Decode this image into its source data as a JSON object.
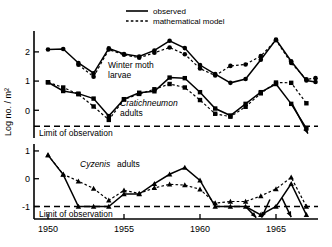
{
  "chart_data": {
    "type": "line",
    "title": "",
    "xlabel": "",
    "ylabel": "Log no. / m²",
    "xlim": [
      1949.3,
      1967.9
    ],
    "xticks": [
      1950,
      1955,
      1960,
      1965
    ],
    "xticklabels": [
      "1950",
      "1955",
      "1960",
      "1965"
    ],
    "grid": false,
    "legend": {
      "position": "top-center",
      "entries": [
        {
          "label": "observed",
          "style": "solid"
        },
        {
          "label": "mathematical model",
          "style": "dashed"
        }
      ]
    },
    "panels": [
      {
        "name": "upper-panel",
        "ylim": [
          -0.95,
          2.75
        ],
        "yticks": [
          0,
          1,
          2
        ],
        "yticklabels": [
          "0",
          "1",
          "2"
        ],
        "limit_of_observation": {
          "label": "Limit of observation",
          "value": -0.55
        },
        "series": [
          {
            "name": "Winter moth larvae",
            "annotation": "Winter moth\nlarvae",
            "annotation_italic": false,
            "marker": "circle",
            "style": "solid",
            "x": [
              1950,
              1951,
              1952,
              1953,
              1954,
              1955,
              1956,
              1957,
              1958,
              1959,
              1960,
              1961,
              1962,
              1963,
              1964,
              1965,
              1966,
              1967,
              1967.6
            ],
            "y": [
              2.08,
              2.1,
              1.62,
              1.27,
              2.12,
              1.93,
              1.84,
              2.05,
              2.38,
              2.13,
              1.55,
              1.24,
              0.94,
              1.07,
              1.73,
              2.42,
              1.68,
              1.02,
              0.97
            ]
          },
          {
            "name": "Winter moth larvae model",
            "marker": "circle",
            "style": "dashed",
            "x": [
              1952,
              1953,
              1954,
              1955,
              1956,
              1957,
              1958,
              1959,
              1960,
              1961,
              1962,
              1963,
              1964,
              1965,
              1966,
              1967,
              1967.6
            ],
            "y": [
              1.56,
              1.15,
              2.08,
              1.9,
              1.8,
              1.97,
              2.15,
              1.92,
              1.43,
              1.19,
              1.52,
              1.57,
              1.86,
              2.4,
              1.62,
              1.06,
              1.1
            ]
          },
          {
            "name": "Cratichneumon adults",
            "annotation": "Cratichneumon\nadults",
            "annotation_italic": true,
            "marker": "square",
            "style": "solid",
            "x": [
              1950,
              1951,
              1952,
              1953,
              1954,
              1955,
              1956,
              1957,
              1958,
              1959,
              1960,
              1961,
              1962,
              1963,
              1964,
              1965,
              1966,
              1967
            ],
            "y": [
              0.96,
              0.66,
              0.57,
              0.4,
              -0.2,
              0.38,
              0.6,
              0.65,
              1.12,
              1.1,
              0.62,
              0.06,
              -0.18,
              0.22,
              0.62,
              0.9,
              0.22,
              -0.62
            ]
          },
          {
            "name": "Cratichneumon adults model",
            "marker": "square",
            "style": "dashed",
            "x": [
              1950,
              1951,
              1952,
              1953,
              1954,
              1955,
              1956,
              1957,
              1958,
              1959,
              1960,
              1961,
              1962,
              1963,
              1964,
              1965,
              1966,
              1967
            ],
            "y": [
              0.96,
              0.78,
              0.55,
              0.13,
              -0.33,
              0.37,
              0.56,
              0.72,
              0.9,
              0.78,
              0.35,
              -0.12,
              -0.22,
              0.12,
              0.58,
              0.95,
              0.94,
              0.24
            ]
          }
        ]
      },
      {
        "name": "lower-panel",
        "ylim": [
          -1.45,
          1.25
        ],
        "yticks": [
          -1,
          0,
          1
        ],
        "yticklabels": [
          "-1",
          "0",
          "1"
        ],
        "limit_of_observation": {
          "label": "Limit of observation",
          "value": -1.0
        },
        "series": [
          {
            "name": "Cyzenis adults",
            "annotation": "Cyzenis adults",
            "annotation_italic": true,
            "marker": "triangle",
            "style": "solid",
            "x": [
              1950,
              1951,
              1952,
              1953,
              1954,
              1955,
              1956,
              1957,
              1958,
              1959,
              1960,
              1961,
              1962,
              1963,
              1964,
              1965,
              1966,
              1967
            ],
            "y": [
              0.85,
              0.15,
              -1.0,
              -1.0,
              -1.0,
              -0.55,
              -0.55,
              -0.18,
              0.16,
              0.4,
              -0.06,
              -1.0,
              -1.0,
              -1.0,
              -1.3,
              -1.0,
              -0.18,
              -1.3
            ]
          },
          {
            "name": "Cyzenis adults model",
            "marker": "triangle",
            "style": "dashed",
            "x": [
              1950,
              1951,
              1952,
              1953,
              1954,
              1955,
              1956,
              1957,
              1958,
              1959,
              1960,
              1961,
              1962,
              1963,
              1964,
              1965,
              1966,
              1967
            ],
            "y": [
              0.85,
              0.16,
              -0.09,
              -0.35,
              -0.78,
              -0.42,
              -0.53,
              -0.33,
              -0.2,
              -0.23,
              -0.38,
              -0.88,
              -0.82,
              -0.82,
              -0.62,
              -0.37,
              0.05,
              -1.0
            ]
          }
        ]
      }
    ]
  }
}
